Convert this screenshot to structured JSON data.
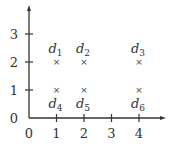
{
  "chart_data": {
    "type": "scatter",
    "title": "",
    "xlabel": "",
    "ylabel": "",
    "xlim": [
      0,
      4.5
    ],
    "ylim": [
      0,
      4
    ],
    "x_ticks": [
      "0",
      "1",
      "2",
      "3",
      "4"
    ],
    "y_ticks": [
      "0",
      "1",
      "2",
      "3"
    ],
    "grid": false,
    "marker": "×",
    "points": [
      {
        "name": "d",
        "sub": "1",
        "x": 1,
        "y": 2,
        "label_pos": "above"
      },
      {
        "name": "d",
        "sub": "2",
        "x": 2,
        "y": 2,
        "label_pos": "above"
      },
      {
        "name": "d",
        "sub": "3",
        "x": 4,
        "y": 2,
        "label_pos": "above"
      },
      {
        "name": "d",
        "sub": "4",
        "x": 1,
        "y": 1,
        "label_pos": "below"
      },
      {
        "name": "d",
        "sub": "5",
        "x": 2,
        "y": 1,
        "label_pos": "below"
      },
      {
        "name": "d",
        "sub": "6",
        "x": 4,
        "y": 1,
        "label_pos": "below"
      }
    ],
    "colors": {
      "axis": "#333333",
      "text": "#333333"
    }
  }
}
